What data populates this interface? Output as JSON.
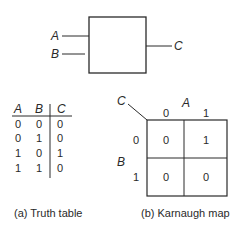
{
  "block_diagram": {
    "inputs": [
      "A",
      "B"
    ],
    "output": "C"
  },
  "truth_table": {
    "headers": [
      "A",
      "B",
      "C"
    ],
    "rows": [
      [
        "0",
        "0",
        "0"
      ],
      [
        "0",
        "1",
        "0"
      ],
      [
        "1",
        "0",
        "1"
      ],
      [
        "1",
        "1",
        "0"
      ]
    ],
    "caption": "(a) Truth table"
  },
  "karnaugh_map": {
    "output_label": "C",
    "col_var": "A",
    "row_var": "B",
    "col_values": [
      "0",
      "1"
    ],
    "row_values": [
      "0",
      "1"
    ],
    "cells": [
      [
        "0",
        "1"
      ],
      [
        "0",
        "0"
      ]
    ],
    "caption": "(b) Karnaugh map"
  }
}
